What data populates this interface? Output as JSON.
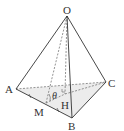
{
  "diagram": {
    "type": "tetrahedron",
    "labels": {
      "O": "O",
      "A": "A",
      "B": "B",
      "C": "C",
      "H": "H",
      "M": "M",
      "theta": "θ"
    },
    "colors": {
      "edge": "#333333",
      "hidden": "#666666",
      "face": "#e6e6e6"
    }
  }
}
